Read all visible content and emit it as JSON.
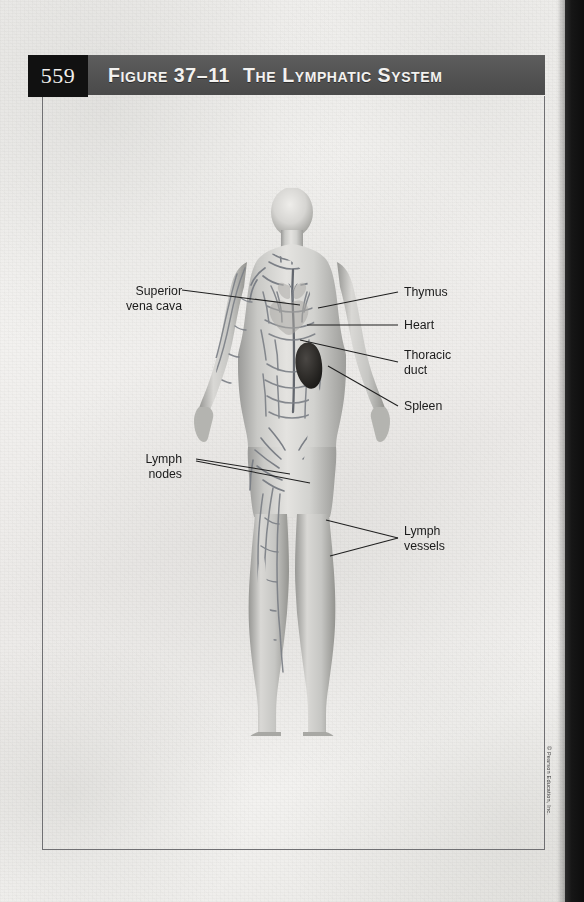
{
  "page": {
    "number": "559",
    "background_color": "#f2f2f0"
  },
  "header": {
    "figure_label": "Figure 37–11",
    "title": "The Lymphatic System",
    "bar_color": "#525252",
    "page_box_color": "#111111",
    "text_color": "#f3f2f0"
  },
  "figure": {
    "alt_name": "human-body-lymphatic-system",
    "organ_accent_color": "#2c2a28",
    "vessel_color": "#7b7f86"
  },
  "labels": [
    {
      "id": "superior-vena-cava",
      "text": "Superior\nvena cava",
      "side": "left"
    },
    {
      "id": "lymph-nodes",
      "text": "Lymph\nnodes",
      "side": "left"
    },
    {
      "id": "thymus",
      "text": "Thymus",
      "side": "right"
    },
    {
      "id": "heart",
      "text": "Heart",
      "side": "right"
    },
    {
      "id": "thoracic-duct",
      "text": "Thoracic\nduct",
      "side": "right"
    },
    {
      "id": "spleen",
      "text": "Spleen",
      "side": "right"
    },
    {
      "id": "lymph-vessels",
      "text": "Lymph\nvessels",
      "side": "right"
    }
  ],
  "credit": {
    "text": "© Pearson Education, Inc."
  }
}
